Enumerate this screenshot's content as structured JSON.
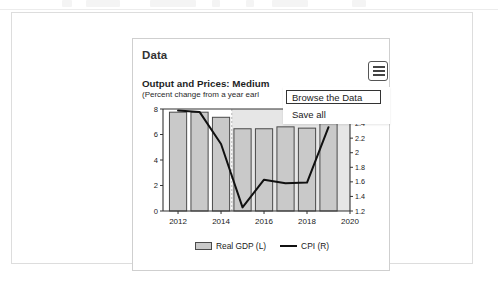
{
  "toolbar": {
    "present": true
  },
  "card": {
    "title": "Data",
    "menu_icon": "hamburger-menu-icon"
  },
  "menu": {
    "items": [
      {
        "label": "Browse the Data",
        "focused": true
      },
      {
        "label": "Save all",
        "focused": false
      }
    ]
  },
  "chart_header": {
    "title": "Output and Prices: Medium",
    "subtitle": "(Percent change from a year earl"
  },
  "legend": {
    "items": [
      {
        "label": "Real GDP (L)",
        "marker": "bar-swatch",
        "color": "#c9c9c9"
      },
      {
        "label": "CPI (R)",
        "marker": "line-swatch",
        "color": "#111111"
      }
    ]
  },
  "colors": {
    "bar_fill": "#c9c9c9",
    "bar_stroke": "#4a4a4a",
    "line": "#111111",
    "axis": "#333333",
    "card_border": "#cfcfcf",
    "panel_border": "#dddddd",
    "shade_band": "#e6e6e6"
  },
  "chart_data": {
    "type": "bar",
    "title": "Output and Prices: Medium",
    "subtitle": "(Percent change from a year earl",
    "xlabel": "",
    "ylabel": "",
    "grid": false,
    "legend_position": "bottom",
    "categories": [
      2012,
      2013,
      2014,
      2015,
      2016,
      2017,
      2018,
      2019
    ],
    "x_ticks": [
      2012,
      2014,
      2016,
      2018,
      2020
    ],
    "xlim": [
      2011.3,
      2020.0
    ],
    "left_axis": {
      "name": "Real GDP (L)",
      "ticks": [
        0,
        2,
        4,
        6,
        8
      ],
      "ylim": [
        0,
        8
      ]
    },
    "right_axis": {
      "name": "CPI (R)",
      "ticks": [
        1.2,
        1.4,
        1.6,
        1.8,
        2.0,
        2.2,
        2.4,
        2.6
      ],
      "tick_labels": [
        "1.2",
        "1.4",
        "1.6",
        "1.8",
        "2",
        "2.2",
        "2.4",
        "2.6"
      ],
      "ylim": [
        1.2,
        2.6
      ]
    },
    "series": [
      {
        "name": "Real GDP (L)",
        "type": "bar",
        "axis": "left",
        "values": [
          7.75,
          7.75,
          7.35,
          6.45,
          6.45,
          6.6,
          6.5,
          6.85
        ]
      },
      {
        "name": "CPI (R)",
        "type": "line",
        "axis": "right",
        "values": [
          2.58,
          2.56,
          2.12,
          1.25,
          1.63,
          1.58,
          1.59,
          2.35
        ]
      }
    ],
    "forecast_band": {
      "start": 2014.5,
      "end": 2020.0,
      "shaded": true
    }
  }
}
